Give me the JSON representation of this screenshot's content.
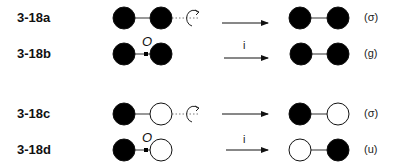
{
  "figure": {
    "rows": [
      {
        "id": "3-18a",
        "label": "3-18a",
        "operation": "rotation",
        "operation_label": "",
        "before": {
          "left": "filled",
          "right": "filled"
        },
        "after": {
          "left": "filled",
          "right": "filled"
        },
        "result": "(σ)"
      },
      {
        "id": "3-18b",
        "label": "3-18b",
        "operation": "inversion",
        "operation_label": "i",
        "center_label": "O",
        "before": {
          "left": "filled",
          "right": "filled"
        },
        "after": {
          "left": "filled",
          "right": "filled"
        },
        "result": "(g)"
      },
      {
        "id": "3-18c",
        "label": "3-18c",
        "operation": "rotation",
        "operation_label": "",
        "before": {
          "left": "filled",
          "right": "open"
        },
        "after": {
          "left": "filled",
          "right": "open"
        },
        "result": "(σ)"
      },
      {
        "id": "3-18d",
        "label": "3-18d",
        "operation": "inversion",
        "operation_label": "i",
        "center_label": "O",
        "before": {
          "left": "filled",
          "right": "open"
        },
        "after": {
          "left": "open",
          "right": "filled"
        },
        "result": "(u)"
      }
    ]
  },
  "colors": {
    "filled": "#000000",
    "open": "#ffffff",
    "stroke": "#111111",
    "bond": "#333333"
  }
}
